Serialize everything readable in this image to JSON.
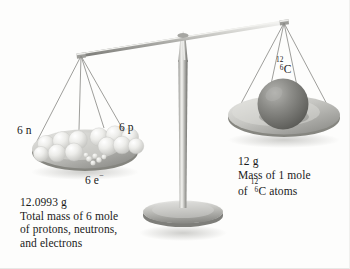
{
  "figure": {
    "background_color": "#fdfdfc",
    "text_color": "#1a1a1a"
  },
  "balance": {
    "beam_name": "balance-beam",
    "fulcrum_name": "balance-fulcrum",
    "base_name": "balance-base",
    "beam_color": "#9a9a96",
    "pan_color": "#b9b9b5",
    "string_color": "#8d8d89"
  },
  "left_pan": {
    "labels": {
      "neutrons": "6 n",
      "protons": "6 p",
      "electrons_value": "6 e",
      "electrons_charge": "−"
    },
    "particle_color": "#ededea",
    "electron_color": "#dcdcd8",
    "caption": {
      "line1": "12.0993 g",
      "line2": "Total mass of 6 mole",
      "line3": "of protons, neutrons,",
      "line4": "and electrons"
    }
  },
  "right_pan": {
    "isotope": {
      "mass_number": "12",
      "atomic_number": "6",
      "element": "C"
    },
    "sphere_color": "#7d7d79",
    "caption": {
      "line1": "12 g",
      "line2": "Mass of 1 mole",
      "line3_prefix": "of ",
      "line3_suffix": "C atoms",
      "line3_mass_number": "12",
      "line3_atomic_number": "6"
    }
  }
}
